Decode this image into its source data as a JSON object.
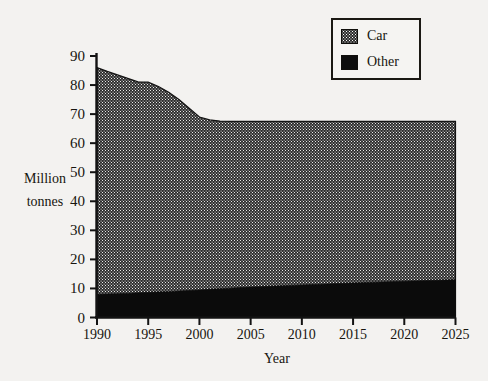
{
  "chart_data": {
    "type": "area",
    "stacked": true,
    "title": "",
    "xlabel": "Year",
    "ylabel": "Million tonnes",
    "ylabel_lines": [
      "Million",
      "tonnes"
    ],
    "x": [
      1990,
      1991,
      1992,
      1993,
      1994,
      1995,
      1996,
      1997,
      1998,
      1999,
      2000,
      2001,
      2002,
      2003,
      2004,
      2005,
      2010,
      2015,
      2020,
      2025
    ],
    "xlim": [
      1990,
      2025
    ],
    "ylim": [
      0,
      90
    ],
    "xticks": [
      "1990",
      "1995",
      "2000",
      "2005",
      "2010",
      "2015",
      "2020",
      "2025"
    ],
    "yticks": [
      "0",
      "10",
      "20",
      "30",
      "40",
      "50",
      "60",
      "70",
      "80",
      "90"
    ],
    "grid": false,
    "legend_position": "top-right",
    "series": [
      {
        "name": "Other",
        "color": "#0d0d0d",
        "pattern": "solid-black",
        "values": [
          8.0,
          8.1,
          8.2,
          8.3,
          8.5,
          8.6,
          8.8,
          8.9,
          9.1,
          9.3,
          9.5,
          9.7,
          9.9,
          10.1,
          10.3,
          10.5,
          11.2,
          11.9,
          12.5,
          13.0
        ]
      },
      {
        "name": "Car",
        "color": "#2b2b2b",
        "pattern": "fine-dotted",
        "values": [
          78.0,
          76.6,
          75.3,
          74.0,
          72.6,
          72.4,
          70.7,
          68.6,
          65.9,
          62.7,
          59.5,
          58.3,
          57.7,
          57.4,
          57.2,
          57.0,
          56.3,
          55.6,
          55.0,
          54.5
        ]
      }
    ],
    "totals": [
      86.0,
      84.7,
      83.5,
      82.3,
      81.1,
      81.0,
      79.5,
      77.5,
      75.0,
      72.0,
      69.0,
      68.0,
      67.6,
      67.5,
      67.5,
      67.5,
      67.5,
      67.5,
      67.5,
      67.5
    ]
  },
  "legend": {
    "items": [
      {
        "label": "Car",
        "swatch": "car-pattern-swatch"
      },
      {
        "label": "Other",
        "swatch": "other-solid-swatch"
      }
    ]
  },
  "axes": {
    "y_title_line1": "Million",
    "y_title_line2": "tonnes",
    "x_title": "Year"
  }
}
